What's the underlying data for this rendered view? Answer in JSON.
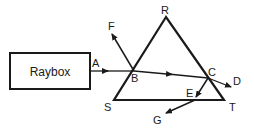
{
  "diagram": {
    "raybox_label": "Raybox",
    "points": {
      "A": "A",
      "B": "B",
      "C": "C",
      "D": "D",
      "E": "E",
      "F": "F",
      "G": "G",
      "R": "R",
      "S": "S",
      "T": "T"
    },
    "colors": {
      "stroke": "#1a1a1a",
      "background": "#ffffff"
    }
  }
}
